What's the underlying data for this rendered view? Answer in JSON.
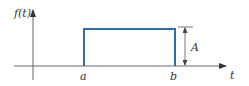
{
  "figure": {
    "type": "rectangular-pulse",
    "y_axis_label": "f(t)",
    "x_axis_label": "t",
    "pulse_start_label": "a",
    "pulse_end_label": "b",
    "amplitude_label": "A"
  },
  "colors": {
    "pulse": "#2a6fa8",
    "axes": "#555555",
    "text": "#333333",
    "background": "#ffffff"
  }
}
